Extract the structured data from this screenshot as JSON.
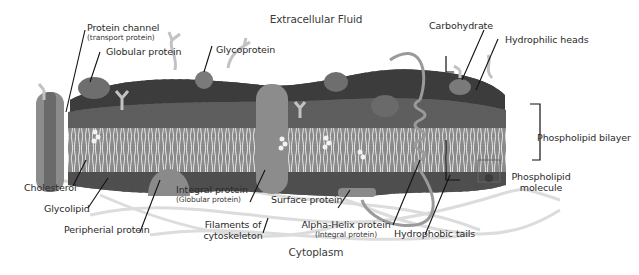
{
  "diagram": {
    "title_top": "Extracellular Fluid",
    "title_bottom": "Cytoplasm",
    "colors": {
      "background": "#ffffff",
      "heads_outer": "#3a3a3a",
      "heads_mid": "#5a5a5a",
      "heads_inner": "#6e6e6e",
      "tails_band": "#8a8a8a",
      "tail_stroke": "#e8e8e8",
      "protein_fill": "#8c8c8c",
      "protein_dark": "#6e6e6e",
      "carb_fill": "#c9c9c9",
      "filament": "#d6d6d6",
      "leader": "#111111",
      "label_text": "#2a2a2a"
    }
  },
  "labels": {
    "protein_channel": {
      "text": "Protein channel",
      "sub": "(transport protein)"
    },
    "globular_protein": {
      "text": "Globular protein"
    },
    "glycoprotein": {
      "text": "Glycoprotein"
    },
    "carbohydrate": {
      "text": "Carbohydrate"
    },
    "hydrophilic_heads": {
      "text": "Hydrophilic heads"
    },
    "phospholipid_bilayer": {
      "text": "Phospholipid bilayer"
    },
    "phospholipid_molecule": {
      "text": "Phospholipid",
      "text2": "molecule"
    },
    "cholesterol": {
      "text": "Cholesterol"
    },
    "glycolipid": {
      "text": "Glycolipid"
    },
    "peripherial_protein": {
      "text": "Peripherial protein"
    },
    "integral_protein": {
      "text": "Integral protein",
      "sub": "(Globular protein)"
    },
    "surface_protein": {
      "text": "Surface protein"
    },
    "filaments": {
      "text": "Filaments of",
      "text2": "cytoskeleton"
    },
    "alpha_helix": {
      "text": "Alpha-Helix protein",
      "sub": "(Integral protein)"
    },
    "hydrophobic_tails": {
      "text": "Hydrophobic tails"
    }
  }
}
